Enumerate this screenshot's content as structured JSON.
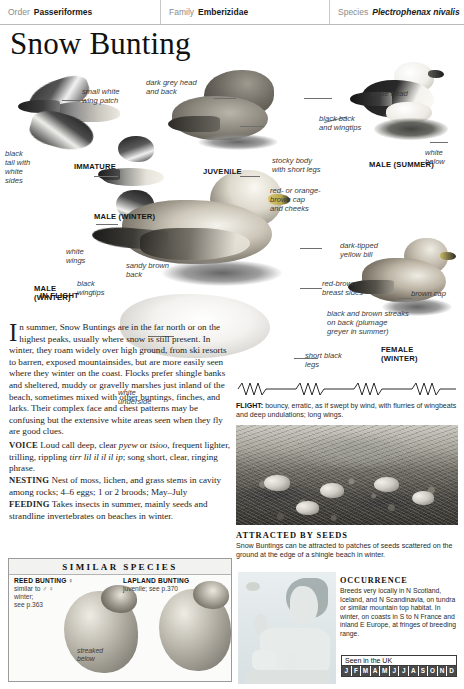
{
  "taxonomy": {
    "order_label": "Order",
    "order_value": "Passeriformes",
    "family_label": "Family",
    "family_value": "Emberizidae",
    "species_label": "Species",
    "species_value": "Plectrophenax nivalis"
  },
  "page_title": "Snow Bunting",
  "plate": {
    "labels": [
      {
        "name": "small-white-wing-patch",
        "text": "small white\nwing patch"
      },
      {
        "name": "black-tail-with-white-sides",
        "text": "black\ntail with\nwhite\nsides"
      },
      {
        "name": "white-wings",
        "text": "white\nwings"
      },
      {
        "name": "black-wingtips",
        "text": "black\nwingtips"
      },
      {
        "name": "dark-grey-head-and-back",
        "text": "dark grey head\nand back"
      },
      {
        "name": "stocky-body-with-short-legs",
        "text": "stocky body\nwith short legs"
      },
      {
        "name": "white-head",
        "text": "white head"
      },
      {
        "name": "black-back-and-wingtips",
        "text": "black back\nand wingtips"
      },
      {
        "name": "white-below",
        "text": "white\nbelow"
      },
      {
        "name": "red-or-orange-brown-cap-and-cheeks",
        "text": "red- or orange-\nbrown cap\nand cheeks"
      },
      {
        "name": "dark-tipped-yellow-bill",
        "text": "dark-tipped\nyellow bill"
      },
      {
        "name": "red-brown-breast-sides",
        "text": "red-brown\nbreast sides"
      },
      {
        "name": "sandy-brown-back",
        "text": "sandy brown\nback"
      },
      {
        "name": "black-and-brown-streaks-on-back",
        "text": "black and brown streaks\non back (plumage\ngreyer in summer)"
      },
      {
        "name": "brown-cap",
        "text": "brown cap"
      },
      {
        "name": "short-black-legs",
        "text": "short black\nlegs"
      },
      {
        "name": "white-underside",
        "text": "white\nunderside"
      }
    ],
    "captions": [
      {
        "name": "caption-immature",
        "text": "IMMATURE"
      },
      {
        "name": "caption-in-flight",
        "text": "IN FLIGHT"
      },
      {
        "name": "caption-male-winter-small",
        "text": "MALE (WINTER)"
      },
      {
        "name": "caption-juvenile",
        "text": "JUVENILE"
      },
      {
        "name": "caption-male-summer",
        "text": "MALE (SUMMER)"
      },
      {
        "name": "caption-male-winter",
        "text": "MALE\n(WINTER)"
      },
      {
        "name": "caption-female-winter",
        "text": "FEMALE\n(WINTER)"
      }
    ]
  },
  "body": {
    "dropcap": "I",
    "paragraph": "n summer, Snow Buntings are in the far north or on the highest peaks, usually where snow is still present. In winter, they roam widely over high ground, from ski resorts to barren, exposed mountainsides, but are more easily seen where they winter on the coast. Flocks prefer shingle banks and sheltered, muddy or gravelly marshes just inland of the beach, sometimes mixed with other buntings, finches, and larks. Their complex face and chest patterns may be confusing but the extensive white areas seen when they fly are good clues.",
    "voice_label": "VOICE",
    "voice_text_1": "Loud call deep, clear ",
    "voice_italic_1": "pyew",
    "voice_text_2": " or ",
    "voice_italic_2": "tsioo",
    "voice_text_3": ", frequent lighter, trilling, rippling ",
    "voice_italic_3": "tirr lil il il il ip",
    "voice_text_4": "; song short, clear, ringing phrase.",
    "nesting_label": "NESTING",
    "nesting_text": "Nest of moss, lichen, and grass stems in cavity among rocks; 4–6 eggs; 1 or 2 broods; May–July",
    "feeding_label": "FEEDING",
    "feeding_text": "Takes insects in summer, mainly seeds and strandline invertebrates on beaches in winter."
  },
  "flight": {
    "label": "FLIGHT:",
    "text": " bouncy, erratic, as if swept by wind, with flurries of wingbeats and deep undulations; long wings."
  },
  "photo_panel": {
    "caption_title": "ATTRACTED BY SEEDS",
    "caption_body": "Snow Buntings can be attracted to patches of seeds scattered on the ground at the edge of a shingle beach in winter."
  },
  "similar_species": {
    "heading": "SIMILAR SPECIES",
    "items": [
      {
        "name": "Reed Bunting",
        "display_name": "REED BUNTING ♀",
        "note": "similar to ♂ ♀\nwinter;\nsee p.363",
        "annotation": "streaked\nbelow"
      },
      {
        "name": "Lapland Bunting",
        "display_name": "LAPLAND BUNTING",
        "note": "juvenile; see p.370",
        "annotation": ""
      }
    ]
  },
  "occurrence": {
    "title": "OCCURRENCE",
    "text": "Breeds very locally in N Scotland, Iceland, and N Scandinavia, on tundra or similar mountain top habitat. In winter, on coasts in S to N France and inland E Europe, at fringes of breeding range."
  },
  "seen_in_uk": {
    "title": "Seen in the UK",
    "months": [
      {
        "letter": "J",
        "active": true
      },
      {
        "letter": "F",
        "active": true
      },
      {
        "letter": "M",
        "active": true
      },
      {
        "letter": "A",
        "active": true
      },
      {
        "letter": "M",
        "active": true
      },
      {
        "letter": "J",
        "active": true
      },
      {
        "letter": "J",
        "active": true
      },
      {
        "letter": "A",
        "active": true
      },
      {
        "letter": "S",
        "active": true
      },
      {
        "letter": "O",
        "active": true
      },
      {
        "letter": "N",
        "active": true
      },
      {
        "letter": "D",
        "active": true
      }
    ]
  },
  "colors": {
    "text": "#1d1d1d",
    "label": "#3a3a3a",
    "rule": "#b9b9b9",
    "month_bar": "#4a4a4a"
  }
}
